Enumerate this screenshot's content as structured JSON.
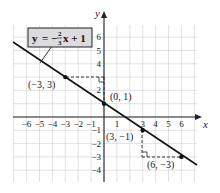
{
  "chart_data": {
    "type": "line",
    "title": "",
    "equation_label": {
      "y": "y",
      "eq": "=",
      "minus": "−",
      "num": "2",
      "den": "3",
      "rest": "x + 1"
    },
    "xlabel": "x",
    "ylabel": "y",
    "xlim": [
      -7,
      7
    ],
    "ylim": [
      -5,
      7
    ],
    "grid": true,
    "x_ticks": [
      "−6",
      "−5",
      "−4",
      "−3",
      "−2",
      "−1",
      "1",
      "3",
      "4",
      "5",
      "6"
    ],
    "y_ticks": [
      "6",
      "5",
      "4",
      "2",
      "−1",
      "−2",
      "−3",
      "−4"
    ],
    "series": [
      {
        "name": "y = -2/3 x + 1",
        "slope": -0.6667,
        "intercept": 1,
        "x": [
          -7,
          8
        ],
        "y": [
          5.667,
          -4.333
        ]
      }
    ],
    "points": [
      {
        "label": "(−3, 3)",
        "x": -3,
        "y": 3
      },
      {
        "label": "(0, 1)",
        "x": 0,
        "y": 1
      },
      {
        "label": "(3, −1)",
        "x": 3,
        "y": -1
      },
      {
        "label": "(6, −3)",
        "x": 6,
        "y": -3
      }
    ],
    "annotations": [
      "rise/run dashed right-angle from (-3,3) to (0,1)",
      "rise/run dashed right-angle from (3,-1) to (6,-3)"
    ]
  },
  "colors": {
    "grid": "#c9c9c9",
    "axis": "#222222",
    "line": "#111111",
    "label_box": "#d9d9d9"
  }
}
